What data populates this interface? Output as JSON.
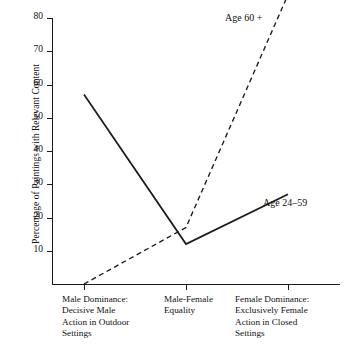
{
  "chart_data": {
    "type": "line",
    "title": "",
    "xlabel": "",
    "ylabel": "Percentage of Paintings with Relevant Content",
    "ylim": [
      0,
      80
    ],
    "yticks": [
      80,
      70,
      60,
      50,
      40,
      30,
      20,
      10
    ],
    "grid": false,
    "legend_position": "inline-annotation",
    "categories": [
      "Male Dominance: Decisive Male Action in Outdoor Settings",
      "Male-Female Equality",
      "Female Dominance: Exclusively Female Action in Closed Settings"
    ],
    "category_lines": [
      [
        "Male Dominance:",
        "Decisive Male",
        "Action in Outdoor",
        "Settings"
      ],
      [
        "Male-Female",
        "Equality"
      ],
      [
        "Female Dominance:",
        "Exclusively Female",
        "Action in Closed",
        "Settings"
      ]
    ],
    "series": [
      {
        "name": "Age 60 +",
        "style": "dashed",
        "color": "#1a1a1a",
        "values": [
          0,
          17,
          87
        ]
      },
      {
        "name": "Age 24–59",
        "style": "solid",
        "color": "#1a1a1a",
        "values": [
          57,
          12,
          27
        ]
      }
    ]
  },
  "annotations": {
    "older_label": "Age 60 +",
    "younger_label": "Age 24–59"
  },
  "axis": {
    "y_title": "Percentage of Paintings with Relevant Content",
    "y_tick_labels": [
      "80",
      "70",
      "60",
      "50",
      "40",
      "30",
      "20",
      "10"
    ]
  }
}
